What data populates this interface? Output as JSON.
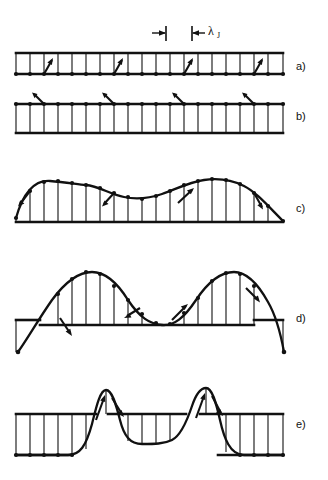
{
  "figure": {
    "kind": "scientific-line-diagram",
    "description_title": "Josephson junction flux penetration stages",
    "background_color": "#ffffff",
    "ink_color": "#111111",
    "width": 328,
    "height": 480
  },
  "scale_marker": {
    "symbol": "λ",
    "subscript": "J",
    "full_label": "λJ",
    "left_tick_x": 166,
    "right_tick_x": 192,
    "y": 33
  },
  "panels": [
    {
      "id": "a",
      "label": "a)",
      "label_x": 296,
      "label_y": 70,
      "rail_top_y": 53,
      "rail_bottom_y": 74,
      "x_start": 16,
      "x_end": 283,
      "rung_count": 20,
      "curve_type": "flat",
      "amplitude": 0,
      "arrow_count": 4,
      "arrow_rungs": [
        3,
        8,
        13,
        18
      ],
      "arrow_direction": "up-right",
      "note": "uniform unperturbed ladder, zero phase gradient"
    },
    {
      "id": "b",
      "label": "b)",
      "label_x": 296,
      "label_y": 120,
      "rail_top_y": 104,
      "rail_bottom_y": 133,
      "x_start": 16,
      "x_end": 283,
      "rung_count": 20,
      "curve_type": "flat",
      "amplitude": 0,
      "arrow_count": 4,
      "arrow_rungs": [
        3,
        8,
        13,
        18
      ],
      "arrow_direction": "up-right-above-rail",
      "note": "small uniform phase, arrows tilt above upper rail"
    },
    {
      "id": "c",
      "label": "c)",
      "label_x": 296,
      "label_y": 212,
      "rail_bottom_y": 222,
      "x_start": 16,
      "x_end": 283,
      "rung_count": 20,
      "curve_type": "double-hump-low",
      "amplitude": 42,
      "arrow_count": 4,
      "arrow_rungs": [
        1,
        7,
        13,
        19
      ],
      "arrow_direction": "mixed",
      "note": "low amplitude two-hump phase profile, ends meet baseline"
    },
    {
      "id": "d",
      "label": "d)",
      "label_x": 296,
      "label_y": 322,
      "rail_bottom_y": 320,
      "x_start": 16,
      "x_end": 283,
      "rung_count": 18,
      "curve_type": "double-hump-high",
      "amplitude": 62,
      "arrow_count": 4,
      "arrow_rungs": [
        5,
        8,
        11,
        16
      ],
      "arrow_direction": "mixed",
      "note": "large two-hump profile, curve crosses below baseline at both ends"
    },
    {
      "id": "e",
      "label": "e)",
      "label_x": 296,
      "label_y": 428,
      "rail_top_y": 414,
      "rail_bottom_y": 455,
      "x_start": 16,
      "x_end": 283,
      "rung_count": 18,
      "curve_type": "two-solitons",
      "amplitude": 44,
      "arrow_count": 4,
      "arrow_rungs": [
        6,
        7,
        11,
        12
      ],
      "arrow_direction": "up",
      "note": "fully formed fluxon pair, sharp spikes above rail with flat plateaus"
    }
  ]
}
